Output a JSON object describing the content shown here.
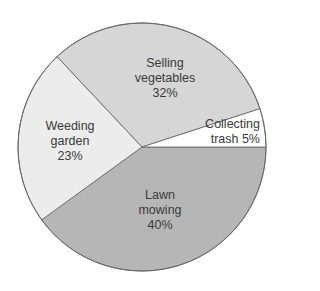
{
  "chart_data": {
    "type": "pie",
    "title": "",
    "categories": [
      "Lawn mowing",
      "Weeding garden",
      "Selling vegetables",
      "Collecting trash"
    ],
    "values": [
      40,
      23,
      32,
      5
    ],
    "unit": "%",
    "colors": [
      "#b6b6b6",
      "#ececec",
      "#d6d6d6",
      "#ffffff"
    ],
    "start_angle_deg": 0,
    "direction": "clockwise",
    "legend": "none (labels inside slices)",
    "labels": [
      {
        "line1": "Lawn",
        "line2": "mowing",
        "pct": "40%"
      },
      {
        "line1": "Weeding",
        "line2": "garden",
        "pct": "23%"
      },
      {
        "line1": "Selling",
        "line2": "vegetables",
        "pct": "32%"
      },
      {
        "line1": "Collecting",
        "line2": "trash 5%"
      }
    ]
  }
}
